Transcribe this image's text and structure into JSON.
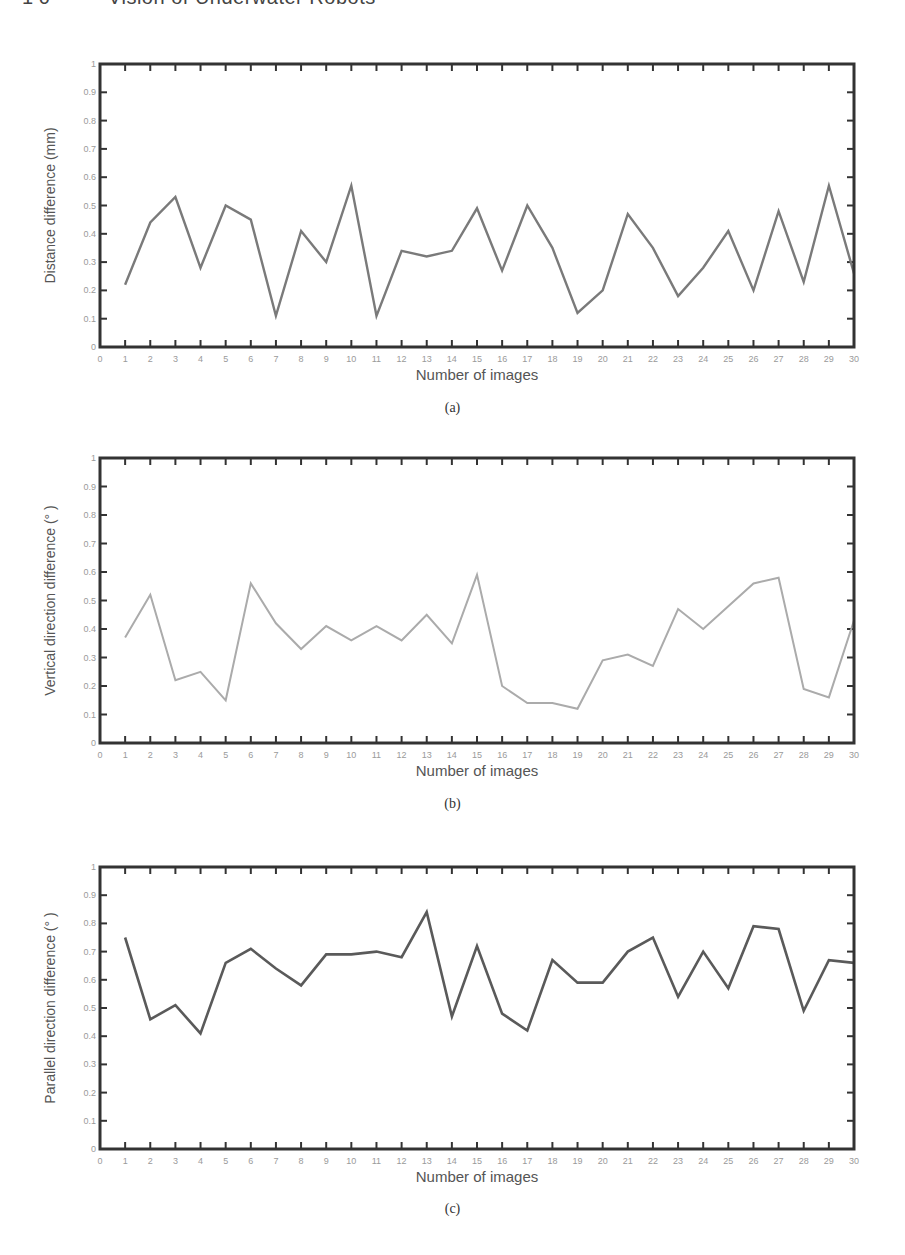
{
  "header": {
    "page_number": "1 0",
    "running_title": "Vision of Underwater Robots"
  },
  "style": {
    "axis_color": "#333333",
    "tick_label_color": "#9a9a9a",
    "axis_label_color": "#555555"
  },
  "figures": [
    {
      "caption": "(a)",
      "top": 64,
      "bottom": 347,
      "caption_y": 410,
      "line_color": "#7a7a7a",
      "line_width": 2.4
    },
    {
      "caption": "(b)",
      "top": 458,
      "bottom": 743,
      "caption_y": 806,
      "line_color": "#ababab",
      "line_width": 2
    },
    {
      "caption": "(c)",
      "top": 867,
      "bottom": 1149,
      "caption_y": 1211,
      "line_color": "#5a5a5a",
      "line_width": 2.6
    }
  ],
  "chart_data": [
    {
      "type": "line",
      "title": "",
      "panel": "(a)",
      "xlabel": "Number of images",
      "ylabel": "Distance difference (mm)",
      "xlim": [
        0,
        30
      ],
      "ylim": [
        0,
        1
      ],
      "xticks": [
        0,
        1,
        2,
        3,
        4,
        5,
        6,
        7,
        8,
        9,
        10,
        11,
        12,
        13,
        14,
        15,
        16,
        17,
        18,
        19,
        20,
        21,
        22,
        23,
        24,
        25,
        26,
        27,
        28,
        29,
        30
      ],
      "yticks": [
        0,
        0.1,
        0.2,
        0.3,
        0.4,
        0.5,
        0.6,
        0.7,
        0.8,
        0.9,
        1
      ],
      "grid": false,
      "x": [
        1,
        2,
        3,
        4,
        5,
        6,
        7,
        8,
        9,
        10,
        11,
        12,
        13,
        14,
        15,
        16,
        17,
        18,
        19,
        20,
        21,
        22,
        23,
        24,
        25,
        26,
        27,
        28,
        29,
        30
      ],
      "values": [
        0.22,
        0.44,
        0.53,
        0.28,
        0.5,
        0.45,
        0.11,
        0.41,
        0.3,
        0.57,
        0.11,
        0.34,
        0.32,
        0.34,
        0.49,
        0.27,
        0.5,
        0.35,
        0.12,
        0.2,
        0.47,
        0.35,
        0.18,
        0.28,
        0.41,
        0.2,
        0.48,
        0.23,
        0.57,
        0.26
      ]
    },
    {
      "type": "line",
      "title": "",
      "panel": "(b)",
      "xlabel": "Number of images",
      "ylabel": "Vertical direction difference (° )",
      "xlim": [
        0,
        30
      ],
      "ylim": [
        0,
        1
      ],
      "xticks": [
        0,
        1,
        2,
        3,
        4,
        5,
        6,
        7,
        8,
        9,
        10,
        11,
        12,
        13,
        14,
        15,
        16,
        17,
        18,
        19,
        20,
        21,
        22,
        23,
        24,
        25,
        26,
        27,
        28,
        29,
        30
      ],
      "yticks": [
        0,
        0.1,
        0.2,
        0.3,
        0.4,
        0.5,
        0.6,
        0.7,
        0.8,
        0.9,
        1
      ],
      "grid": false,
      "x": [
        1,
        2,
        3,
        4,
        5,
        6,
        7,
        8,
        9,
        10,
        11,
        12,
        13,
        14,
        15,
        16,
        17,
        18,
        19,
        20,
        21,
        22,
        23,
        24,
        25,
        26,
        27,
        28,
        29,
        30
      ],
      "values": [
        0.37,
        0.52,
        0.22,
        0.25,
        0.15,
        0.56,
        0.42,
        0.33,
        0.41,
        0.36,
        0.41,
        0.36,
        0.45,
        0.35,
        0.59,
        0.2,
        0.14,
        0.14,
        0.12,
        0.29,
        0.31,
        0.27,
        0.47,
        0.4,
        0.48,
        0.56,
        0.58,
        0.19,
        0.16,
        0.43
      ]
    },
    {
      "type": "line",
      "title": "",
      "panel": "(c)",
      "xlabel": "Number of images",
      "ylabel": "Parallel direction difference (° )",
      "xlim": [
        0,
        30
      ],
      "ylim": [
        0,
        1
      ],
      "xticks": [
        0,
        1,
        2,
        3,
        4,
        5,
        6,
        7,
        8,
        9,
        10,
        11,
        12,
        13,
        14,
        15,
        16,
        17,
        18,
        19,
        20,
        21,
        22,
        23,
        24,
        25,
        26,
        27,
        28,
        29,
        30
      ],
      "yticks": [
        0,
        0.1,
        0.2,
        0.3,
        0.4,
        0.5,
        0.6,
        0.7,
        0.8,
        0.9,
        1
      ],
      "grid": false,
      "x": [
        1,
        2,
        3,
        4,
        5,
        6,
        7,
        8,
        9,
        10,
        11,
        12,
        13,
        14,
        15,
        16,
        17,
        18,
        19,
        20,
        21,
        22,
        23,
        24,
        25,
        26,
        27,
        28,
        29,
        30
      ],
      "values": [
        0.75,
        0.46,
        0.51,
        0.41,
        0.66,
        0.71,
        0.64,
        0.58,
        0.69,
        0.69,
        0.7,
        0.68,
        0.84,
        0.47,
        0.72,
        0.48,
        0.42,
        0.67,
        0.59,
        0.59,
        0.7,
        0.75,
        0.54,
        0.7,
        0.57,
        0.79,
        0.78,
        0.49,
        0.67,
        0.66
      ]
    }
  ]
}
